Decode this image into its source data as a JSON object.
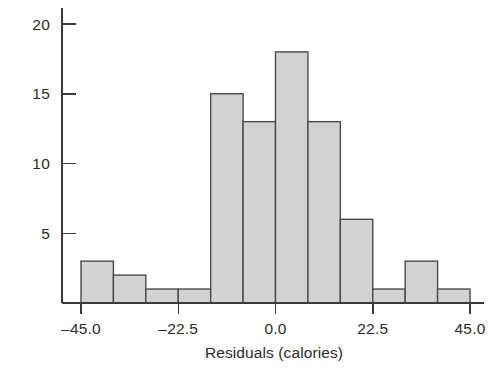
{
  "chart_data": {
    "type": "bar",
    "title": "",
    "subtitle": "",
    "xlabel": "Residuals (calories)",
    "ylabel": "",
    "bin_width": 7.5,
    "bin_edges": [
      -45.0,
      -37.5,
      -30.0,
      -22.5,
      -15.0,
      -7.5,
      0.0,
      7.5,
      15.0,
      22.5,
      30.0,
      37.5,
      45.0
    ],
    "categories": [
      "-45.0 to -37.5",
      "-37.5 to -30.0",
      "-30.0 to -22.5",
      "-22.5 to -15.0",
      "-15.0 to -7.5",
      "-7.5 to 0.0",
      "0.0 to 7.5",
      "7.5 to 15.0",
      "15.0 to 22.5",
      "22.5 to 30.0",
      "30.0 to 37.5",
      "37.5 to 45.0"
    ],
    "values": [
      3,
      2,
      1,
      1,
      15,
      13,
      18,
      13,
      6,
      1,
      3,
      1
    ],
    "xlim": [
      -45.0,
      45.0
    ],
    "ylim": [
      0,
      21.5
    ],
    "xticks": [
      -45.0,
      -22.5,
      0.0,
      22.5,
      45.0
    ],
    "xtick_labels": [
      "–45.0",
      "–22.5",
      "0.0",
      "22.5",
      "45.0"
    ],
    "yticks": [
      5,
      10,
      15,
      20
    ],
    "ytick_labels": [
      "5",
      "10",
      "15",
      "20"
    ],
    "grid": false,
    "legend": null,
    "bar_fill_color": "#d2d2d2",
    "bar_edge_color": "#4a4a4a",
    "axis_color": "#3a3a3a",
    "background_color": "#ffffff"
  }
}
